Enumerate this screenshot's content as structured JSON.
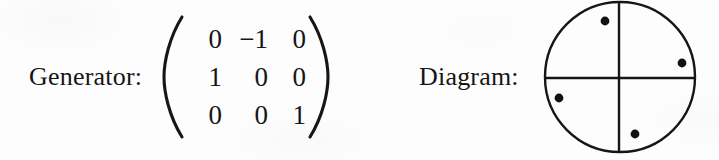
{
  "figure": {
    "background_color": "#fdfdfd",
    "ink_color": "#161616",
    "generator_label": "Generator:",
    "diagram_label": "Diagram:",
    "matrix": {
      "left_delimiter": "(",
      "right_delimiter": ")",
      "rows": [
        [
          "0",
          "−1",
          "0"
        ],
        [
          "1",
          "0",
          "0"
        ],
        [
          "0",
          "0",
          "1"
        ]
      ]
    },
    "diagram": {
      "shape": "circle",
      "circle": {
        "cx": 80,
        "cy": 77,
        "r": 75
      },
      "axes": [
        {
          "name": "vertical-axis",
          "x1": 79,
          "y1": 2,
          "x2": 79,
          "y2": 152
        },
        {
          "name": "horizontal-axis",
          "x1": 5,
          "y1": 78,
          "x2": 155,
          "y2": 78
        }
      ],
      "dots": [
        {
          "name": "dot-upper-left",
          "cx": 65,
          "cy": 21,
          "r": 4.3
        },
        {
          "name": "dot-right",
          "cx": 142,
          "cy": 63,
          "r": 4.3
        },
        {
          "name": "dot-lower-left",
          "cx": 19,
          "cy": 98,
          "r": 4.3
        },
        {
          "name": "dot-bottom",
          "cx": 95,
          "cy": 134,
          "r": 4.3
        }
      ]
    }
  }
}
